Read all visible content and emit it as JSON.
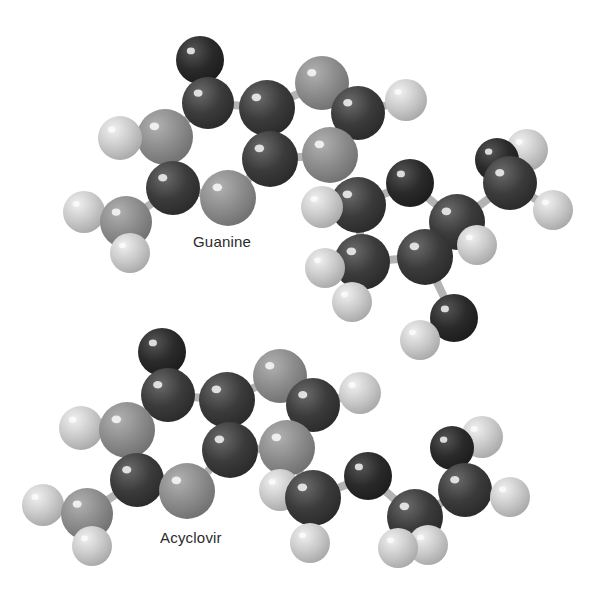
{
  "figure": {
    "style": "grayscale ball-and-stick molecular models",
    "background": "#ffffff",
    "atom_colors": {
      "C": "#3b3b3b",
      "O": "#2a2a2a",
      "N": "#8c8c8c",
      "H": "#c9c9c9"
    },
    "bond_color": "#b3b3b3",
    "legend_note": "C = carbon (dark), O = oxygen (darkest), N = nitrogen (medium gray), H = hydrogen (light)"
  },
  "molecules": [
    {
      "name": "Guanine",
      "label": "Guanine",
      "label_pos": {
        "x": 193,
        "y": 241
      },
      "atoms": [
        {
          "id": "O1",
          "el": "O",
          "x": 200,
          "y": 60,
          "r": 24
        },
        {
          "id": "C1",
          "el": "C",
          "x": 208,
          "y": 103,
          "r": 26
        },
        {
          "id": "C2",
          "el": "C",
          "x": 267,
          "y": 108,
          "r": 28
        },
        {
          "id": "N1",
          "el": "N",
          "x": 322,
          "y": 83,
          "r": 27
        },
        {
          "id": "C3",
          "el": "C",
          "x": 358,
          "y": 113,
          "r": 27
        },
        {
          "id": "H1",
          "el": "H",
          "x": 406,
          "y": 100,
          "r": 21
        },
        {
          "id": "N2",
          "el": "N",
          "x": 165,
          "y": 137,
          "r": 28
        },
        {
          "id": "H2",
          "el": "H",
          "x": 120,
          "y": 138,
          "r": 22
        },
        {
          "id": "C4",
          "el": "C",
          "x": 270,
          "y": 159,
          "r": 28
        },
        {
          "id": "N3",
          "el": "N",
          "x": 330,
          "y": 155,
          "r": 28
        },
        {
          "id": "C5",
          "el": "C",
          "x": 173,
          "y": 188,
          "r": 27
        },
        {
          "id": "N4",
          "el": "N",
          "x": 228,
          "y": 198,
          "r": 28
        },
        {
          "id": "N5",
          "el": "N",
          "x": 126,
          "y": 222,
          "r": 26
        },
        {
          "id": "H3",
          "el": "H",
          "x": 84,
          "y": 212,
          "r": 21
        },
        {
          "id": "H4",
          "el": "H",
          "x": 130,
          "y": 253,
          "r": 20
        }
      ],
      "bonds": [
        [
          "O1",
          "C1"
        ],
        [
          "C1",
          "C2"
        ],
        [
          "C2",
          "N1"
        ],
        [
          "N1",
          "C3"
        ],
        [
          "C3",
          "H1"
        ],
        [
          "C1",
          "N2"
        ],
        [
          "N2",
          "H2"
        ],
        [
          "C2",
          "C4"
        ],
        [
          "C3",
          "N3"
        ],
        [
          "C4",
          "N3"
        ],
        [
          "N2",
          "C5"
        ],
        [
          "C5",
          "N4"
        ],
        [
          "N4",
          "C4"
        ],
        [
          "C5",
          "N5"
        ],
        [
          "N5",
          "H3"
        ],
        [
          "N5",
          "H4"
        ]
      ]
    },
    {
      "name": "Acyclovir side chain (upper right)",
      "label": "",
      "atoms": [
        {
          "id": "C6",
          "el": "C",
          "x": 358,
          "y": 205,
          "r": 28
        },
        {
          "id": "H5",
          "el": "H",
          "x": 322,
          "y": 207,
          "r": 21
        },
        {
          "id": "O2",
          "el": "O",
          "x": 410,
          "y": 183,
          "r": 24
        },
        {
          "id": "C7",
          "el": "C",
          "x": 457,
          "y": 222,
          "r": 28
        },
        {
          "id": "O3",
          "el": "O",
          "x": 497,
          "y": 160,
          "r": 22
        },
        {
          "id": "C8",
          "el": "C",
          "x": 510,
          "y": 183,
          "r": 27
        },
        {
          "id": "H6",
          "el": "H",
          "x": 527,
          "y": 150,
          "r": 21
        },
        {
          "id": "H7",
          "el": "H",
          "x": 553,
          "y": 210,
          "r": 20
        },
        {
          "id": "C9",
          "el": "C",
          "x": 362,
          "y": 262,
          "r": 28
        },
        {
          "id": "H8",
          "el": "H",
          "x": 325,
          "y": 268,
          "r": 20
        },
        {
          "id": "H9",
          "el": "H",
          "x": 352,
          "y": 302,
          "r": 20
        },
        {
          "id": "C10",
          "el": "C",
          "x": 425,
          "y": 257,
          "r": 28
        },
        {
          "id": "H10",
          "el": "H",
          "x": 477,
          "y": 245,
          "r": 20
        },
        {
          "id": "O4",
          "el": "O",
          "x": 454,
          "y": 318,
          "r": 24
        },
        {
          "id": "H11",
          "el": "H",
          "x": 420,
          "y": 340,
          "r": 20
        }
      ],
      "bonds": [
        [
          "C6",
          "H5"
        ],
        [
          "C6",
          "O2"
        ],
        [
          "O2",
          "C7"
        ],
        [
          "C7",
          "C8"
        ],
        [
          "C8",
          "O3"
        ],
        [
          "C8",
          "H6"
        ],
        [
          "C8",
          "H7"
        ],
        [
          "C6",
          "C9"
        ],
        [
          "C9",
          "H8"
        ],
        [
          "C9",
          "H9"
        ],
        [
          "C9",
          "C10"
        ],
        [
          "C10",
          "C7"
        ],
        [
          "C7",
          "H10"
        ],
        [
          "C10",
          "O4"
        ],
        [
          "O4",
          "H11"
        ]
      ]
    },
    {
      "name": "Acyclovir",
      "label": "Acyclovir",
      "label_pos": {
        "x": 160,
        "y": 536
      },
      "atoms": [
        {
          "id": "O1",
          "el": "O",
          "x": 162,
          "y": 352,
          "r": 24
        },
        {
          "id": "C1",
          "el": "C",
          "x": 168,
          "y": 395,
          "r": 27
        },
        {
          "id": "C2",
          "el": "C",
          "x": 227,
          "y": 400,
          "r": 28
        },
        {
          "id": "N1",
          "el": "N",
          "x": 280,
          "y": 376,
          "r": 27
        },
        {
          "id": "C3",
          "el": "C",
          "x": 313,
          "y": 405,
          "r": 27
        },
        {
          "id": "H1",
          "el": "H",
          "x": 360,
          "y": 393,
          "r": 21
        },
        {
          "id": "N2",
          "el": "N",
          "x": 127,
          "y": 430,
          "r": 28
        },
        {
          "id": "H2",
          "el": "H",
          "x": 81,
          "y": 428,
          "r": 22
        },
        {
          "id": "C4",
          "el": "C",
          "x": 230,
          "y": 450,
          "r": 28
        },
        {
          "id": "N3",
          "el": "N",
          "x": 287,
          "y": 448,
          "r": 28
        },
        {
          "id": "C5",
          "el": "C",
          "x": 137,
          "y": 480,
          "r": 27
        },
        {
          "id": "N4",
          "el": "N",
          "x": 187,
          "y": 491,
          "r": 28
        },
        {
          "id": "N5",
          "el": "N",
          "x": 87,
          "y": 514,
          "r": 26
        },
        {
          "id": "H3",
          "el": "H",
          "x": 43,
          "y": 505,
          "r": 21
        },
        {
          "id": "H4",
          "el": "H",
          "x": 92,
          "y": 546,
          "r": 20
        },
        {
          "id": "C6",
          "el": "C",
          "x": 313,
          "y": 498,
          "r": 28
        },
        {
          "id": "H5",
          "el": "H",
          "x": 280,
          "y": 490,
          "r": 21
        },
        {
          "id": "H6",
          "el": "H",
          "x": 310,
          "y": 543,
          "r": 20
        },
        {
          "id": "O2",
          "el": "O",
          "x": 368,
          "y": 476,
          "r": 24
        },
        {
          "id": "C7",
          "el": "C",
          "x": 415,
          "y": 517,
          "r": 28
        },
        {
          "id": "H7",
          "el": "H",
          "x": 398,
          "y": 548,
          "r": 20
        },
        {
          "id": "H8",
          "el": "H",
          "x": 428,
          "y": 545,
          "r": 20
        },
        {
          "id": "C8",
          "el": "C",
          "x": 465,
          "y": 490,
          "r": 27
        },
        {
          "id": "O3",
          "el": "O",
          "x": 452,
          "y": 448,
          "r": 22
        },
        {
          "id": "H9",
          "el": "H",
          "x": 482,
          "y": 437,
          "r": 21
        },
        {
          "id": "H10",
          "el": "H",
          "x": 510,
          "y": 497,
          "r": 20
        }
      ],
      "bonds": [
        [
          "O1",
          "C1"
        ],
        [
          "C1",
          "C2"
        ],
        [
          "C2",
          "N1"
        ],
        [
          "N1",
          "C3"
        ],
        [
          "C3",
          "H1"
        ],
        [
          "C1",
          "N2"
        ],
        [
          "N2",
          "H2"
        ],
        [
          "C2",
          "C4"
        ],
        [
          "C3",
          "N3"
        ],
        [
          "C4",
          "N3"
        ],
        [
          "N2",
          "C5"
        ],
        [
          "C5",
          "N4"
        ],
        [
          "N4",
          "C4"
        ],
        [
          "C5",
          "N5"
        ],
        [
          "N5",
          "H3"
        ],
        [
          "N5",
          "H4"
        ],
        [
          "N3",
          "C6"
        ],
        [
          "C6",
          "H5"
        ],
        [
          "C6",
          "H6"
        ],
        [
          "C6",
          "O2"
        ],
        [
          "O2",
          "C7"
        ],
        [
          "C7",
          "H7"
        ],
        [
          "C7",
          "H8"
        ],
        [
          "C7",
          "C8"
        ],
        [
          "C8",
          "O3"
        ],
        [
          "O3",
          "H9"
        ],
        [
          "C8",
          "H10"
        ]
      ]
    }
  ]
}
